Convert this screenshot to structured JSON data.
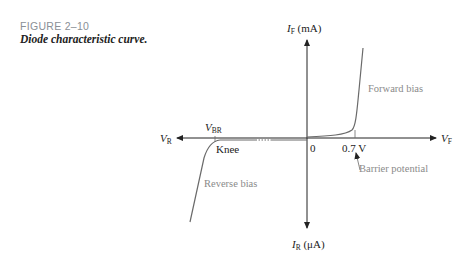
{
  "figure": {
    "number": "FIGURE 2–10",
    "title": "Diode characteristic curve."
  },
  "axes": {
    "y_top": {
      "var": "I",
      "sub": "F",
      "unit": " (mA)"
    },
    "y_bottom": {
      "var": "I",
      "sub": "R",
      "unit": " (μA)"
    },
    "x_left": {
      "var": "V",
      "sub": "R"
    },
    "x_right": {
      "var": "V",
      "sub": "F"
    },
    "origin": "0"
  },
  "annotations": {
    "vbr": {
      "var": "V",
      "sub": "BR"
    },
    "knee": "Knee",
    "threshold": "0.7 V",
    "forward_bias": "Forward bias",
    "reverse_bias": "Reverse bias",
    "barrier_potential": "Barrier potential"
  },
  "colors": {
    "axis": "#222222",
    "curve": "#6a6a6a",
    "gray_text": "#8a8a8a"
  }
}
